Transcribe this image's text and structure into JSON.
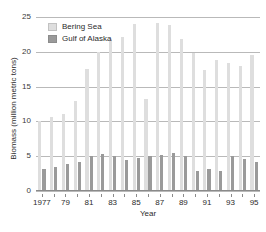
{
  "chart_data": {
    "type": "bar",
    "title": "",
    "subtitle": "",
    "xlabel": "Year",
    "ylabel": "Biomass (million metric tons)",
    "ylim": [
      0,
      25
    ],
    "yticks": [
      0,
      5,
      10,
      15,
      20,
      25
    ],
    "ytick_labels": [
      "0",
      "5",
      "10",
      "15",
      "20",
      "25"
    ],
    "grid": true,
    "legend_position": "top-left",
    "categories": [
      1977,
      1978,
      1979,
      1980,
      1981,
      1982,
      1983,
      1984,
      1985,
      1986,
      1987,
      1988,
      1989,
      1990,
      1991,
      1992,
      1993,
      1994,
      1995
    ],
    "xtick_labels": [
      "1977",
      "",
      "79",
      "",
      "81",
      "",
      "83",
      "",
      "85",
      "",
      "87",
      "",
      "89",
      "",
      "91",
      "",
      "93",
      "",
      "95"
    ],
    "series": [
      {
        "name": "Bering Sea",
        "color": "#dedede",
        "values": [
          10.0,
          10.6,
          11.1,
          12.9,
          17.6,
          20.0,
          21.9,
          22.1,
          24.0,
          13.2,
          24.1,
          23.9,
          21.9,
          19.8,
          17.4,
          18.8,
          18.4,
          18.0,
          19.6
        ]
      },
      {
        "name": "Gulf of Alaska",
        "color": "#9a9a9a",
        "values": [
          3.2,
          3.4,
          3.9,
          4.2,
          5.1,
          5.3,
          5.0,
          4.5,
          4.8,
          5.1,
          5.2,
          5.4,
          5.1,
          2.9,
          3.1,
          2.9,
          5.1,
          4.6,
          4.2
        ]
      }
    ]
  },
  "legend": {
    "items": [
      {
        "label": "Bering Sea",
        "swatch": "light-gray-swatch-icon"
      },
      {
        "label": "Gulf of Alaska",
        "swatch": "dark-gray-swatch-icon"
      }
    ]
  },
  "axes": {
    "y_title": "Biomass (million metric tons)",
    "x_title": "Year"
  }
}
